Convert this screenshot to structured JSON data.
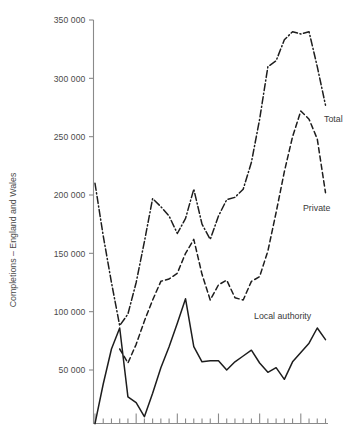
{
  "chart_data": {
    "type": "line",
    "title": "",
    "xlabel": "",
    "ylabel": "Completions – England and Wales",
    "ylim": [
      0,
      350000
    ],
    "ytick_labels": [
      "350 000",
      "300 000",
      "250 000",
      "200 000",
      "150 000",
      "100 000",
      "50 000"
    ],
    "ytick_values": [
      350000,
      300000,
      250000,
      200000,
      150000,
      100000,
      50000
    ],
    "xlim": [
      0,
      29
    ],
    "x_tick_labels": [],
    "x_minor_tick_count": 29,
    "x_major_tick_every": 5,
    "grid": false,
    "legend_position": "inline-right",
    "x": [
      0,
      1,
      2,
      3,
      4,
      5,
      6,
      7,
      8,
      9,
      10,
      11,
      12,
      13,
      14,
      15,
      16,
      17,
      18,
      19,
      20,
      21,
      22,
      23,
      24,
      25,
      26,
      27,
      28
    ],
    "series": [
      {
        "name": "Total",
        "style": "dash-dot",
        "values": [
          210000,
          165000,
          125000,
          88000,
          98000,
          125000,
          160000,
          197000,
          190000,
          182000,
          167000,
          180000,
          205000,
          175000,
          162000,
          182000,
          196000,
          198000,
          205000,
          228000,
          265000,
          310000,
          315000,
          333000,
          340000,
          338000,
          340000,
          310000,
          277000
        ]
      },
      {
        "name": "Private",
        "style": "dashed",
        "values": [
          null,
          null,
          null,
          68000,
          56000,
          72000,
          92000,
          110000,
          126000,
          128000,
          133000,
          150000,
          162000,
          132000,
          110000,
          123000,
          127000,
          112000,
          110000,
          126000,
          130000,
          152000,
          185000,
          220000,
          250000,
          272000,
          265000,
          248000,
          202000
        ]
      },
      {
        "name": "Local authority",
        "style": "solid",
        "values": [
          4000,
          38000,
          68000,
          86000,
          27000,
          22000,
          10000,
          30000,
          52000,
          70000,
          90000,
          111000,
          70000,
          57000,
          58000,
          58000,
          50000,
          57000,
          62000,
          67000,
          56000,
          48000,
          52000,
          42000,
          57000,
          65000,
          73000,
          86000,
          76000
        ]
      }
    ],
    "annotations": [
      {
        "name": "Total",
        "text": "Total",
        "x": 324,
        "y": 122
      },
      {
        "name": "Private",
        "text": "Private",
        "x": 303,
        "y": 211
      },
      {
        "name": "Local authority",
        "text": "Local authority",
        "x": 254,
        "y": 319
      }
    ],
    "colors": {
      "line": "#1d1d1d",
      "axis": "#8a8a8a",
      "text": "#4a4a4a",
      "background": "#ffffff"
    }
  }
}
